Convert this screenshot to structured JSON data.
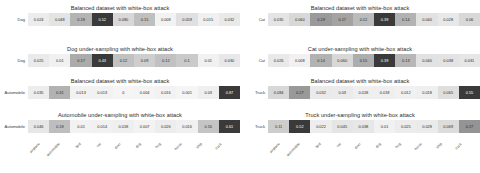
{
  "figure": {
    "background": "#ffffff",
    "colormap_low": "#f5f5f5",
    "colormap_high": "#3a3a3a"
  },
  "classes": [
    "airplane",
    "automobile",
    "bird",
    "cat",
    "deer",
    "dog",
    "frog",
    "horse",
    "ship",
    "truck"
  ],
  "chart_data": [
    {
      "type": "heatmap",
      "title": "Balanced dataset with white-box attack",
      "row_label": "Dog",
      "xlabel": "",
      "ylabel": "",
      "categories": [
        "airplane",
        "automobile",
        "bird",
        "cat",
        "deer",
        "dog",
        "frog",
        "horse",
        "ship",
        "truck"
      ],
      "values": [
        0.024,
        0.048,
        0.18,
        0.52,
        0.08,
        0.15,
        0.008,
        0.059,
        0.015,
        0.032
      ],
      "labels": [
        "0.024",
        "0.048",
        "0.18",
        "0.52",
        "0.080",
        "0.15",
        "0.008",
        "0.059",
        "0.015",
        "0.032"
      ],
      "clim": [
        0,
        0.52
      ],
      "grid": false,
      "legend": "none"
    },
    {
      "type": "heatmap",
      "title": "Dog under-sampling with white-box attack",
      "row_label": "Dog",
      "xlabel": "",
      "ylabel": "",
      "categories": [
        "airplane",
        "automobile",
        "bird",
        "cat",
        "deer",
        "dog",
        "frog",
        "horse",
        "ship",
        "truck"
      ],
      "values": [
        0.025,
        0.01,
        0.17,
        0.43,
        0.12,
        0.09,
        0.12,
        0.1,
        0.01,
        0.03
      ],
      "labels": [
        "0.025",
        "0.01",
        "0.17",
        "0.43",
        "0.12",
        "0.09",
        "0.12",
        "0.1",
        "0.01",
        "0.030"
      ],
      "clim": [
        0,
        0.43
      ],
      "grid": false,
      "legend": "none"
    },
    {
      "type": "heatmap",
      "title": "Balanced dataset with white-box attack",
      "row_label": "Automobile",
      "xlabel": "",
      "ylabel": "",
      "categories": [
        "airplane",
        "automobile",
        "bird",
        "cat",
        "deer",
        "dog",
        "frog",
        "horse",
        "ship",
        "truck"
      ],
      "values": [
        0.035,
        0.31,
        0.013,
        0.013,
        0,
        0.004,
        0.016,
        0.001,
        0.03,
        0.87
      ],
      "labels": [
        "0.035",
        "0.31",
        "0.013",
        "0.013",
        "0",
        "0.004",
        "0.016",
        "0.001",
        "0.03",
        "0.87"
      ],
      "clim": [
        0,
        0.87
      ],
      "grid": false,
      "legend": "none"
    },
    {
      "type": "heatmap",
      "title": "Automobile under-sampling with white-box attack",
      "row_label": "Automobile",
      "xlabel": "",
      "ylabel": "",
      "categories": [
        "airplane",
        "automobile",
        "bird",
        "cat",
        "deer",
        "dog",
        "frog",
        "horse",
        "ship",
        "truck"
      ],
      "values": [
        0.046,
        0.18,
        0.01,
        0.014,
        0.018,
        0.007,
        0.026,
        0.016,
        0.16,
        0.61
      ],
      "labels": [
        "0.046",
        "0.18",
        "0.01",
        "0.014",
        "0.018",
        "0.007",
        "0.026",
        "0.016",
        "0.16",
        "0.61"
      ],
      "clim": [
        0,
        0.61
      ],
      "grid": false,
      "legend": "none"
    },
    {
      "type": "heatmap",
      "title": "Balanced dataset with white-box attack",
      "row_label": "Cat",
      "xlabel": "",
      "ylabel": "",
      "categories": [
        "airplane",
        "automobile",
        "bird",
        "cat",
        "deer",
        "dog",
        "frog",
        "horse",
        "ship",
        "truck"
      ],
      "values": [
        0.035,
        0.06,
        0.19,
        0.17,
        0.12,
        0.39,
        0.14,
        0.04,
        0.028,
        0.06
      ],
      "labels": [
        "0.035",
        "0.060",
        "0.19",
        "0.17",
        "0.12",
        "0.39",
        "0.14",
        "0.040",
        "0.028",
        "0.06"
      ],
      "clim": [
        0,
        0.39
      ],
      "grid": false,
      "legend": "none"
    },
    {
      "type": "heatmap",
      "title": "Cat under-sampling with white-box attack",
      "row_label": "Cat",
      "xlabel": "",
      "ylabel": "",
      "categories": [
        "airplane",
        "automobile",
        "bird",
        "cat",
        "deer",
        "dog",
        "frog",
        "horse",
        "ship",
        "truck"
      ],
      "values": [
        0.026,
        0.008,
        0.14,
        0.06,
        0.15,
        0.39,
        0.13,
        0.04,
        0.038,
        0.031
      ],
      "labels": [
        "0.026",
        "0.008",
        "0.14",
        "0.060",
        "0.15",
        "0.39",
        "0.13",
        "0.040",
        "0.038",
        "0.031"
      ],
      "clim": [
        0,
        0.39
      ],
      "grid": false,
      "legend": "none"
    },
    {
      "type": "heatmap",
      "title": "Balanced dataset with white-box attack",
      "row_label": "Truck",
      "xlabel": "",
      "ylabel": "",
      "categories": [
        "airplane",
        "automobile",
        "bird",
        "cat",
        "deer",
        "dog",
        "frog",
        "horse",
        "ship",
        "truck"
      ],
      "values": [
        0.084,
        0.27,
        0.032,
        0.03,
        0.018,
        0.018,
        0.012,
        0.018,
        0.065,
        0.55
      ],
      "labels": [
        "0.084",
        "0.27",
        "0.032",
        "0.03",
        "0.018",
        "0.018",
        "0.012",
        "0.018",
        "0.065",
        "0.55"
      ],
      "clim": [
        0,
        0.55
      ],
      "grid": false,
      "legend": "none"
    },
    {
      "type": "heatmap",
      "title": "Truck under-sampling with white-box attack",
      "row_label": "Truck",
      "xlabel": "",
      "ylabel": "",
      "categories": [
        "airplane",
        "automobile",
        "bird",
        "cat",
        "deer",
        "dog",
        "frog",
        "horse",
        "ship",
        "truck"
      ],
      "values": [
        0.11,
        0.52,
        0.022,
        0.045,
        0.038,
        0.01,
        0.025,
        0.028,
        0.069,
        0.27
      ],
      "labels": [
        "0.11",
        "0.52",
        "0.022",
        "0.045",
        "0.038",
        "0.01",
        "0.025",
        "0.028",
        "0.069",
        "0.27"
      ],
      "clim": [
        0,
        0.52
      ],
      "grid": false,
      "legend": "none"
    }
  ]
}
